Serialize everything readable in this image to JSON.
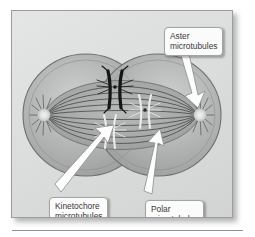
{
  "figure": {
    "domain_subject": "mitotic spindle diagram",
    "callouts": [
      {
        "id": "aster",
        "line1": "Aster",
        "line2": "microtubules",
        "points_to": "right-aster-starburst"
      },
      {
        "id": "kinetochore",
        "line1": "Kinetochore",
        "line2": "microtubules",
        "points_to": "lower-left-chromosome-kinetochore"
      },
      {
        "id": "polar",
        "line1": "Polar",
        "line2": "microtubules",
        "points_to": "overlapping-spindle-fibers"
      }
    ],
    "colors": {
      "panel_background_light": "#e4e5e5",
      "panel_background_dark": "#d2d3d3",
      "panel_border": "#9b9c9c",
      "cell_fill": "#a9aaaa",
      "cell_outline": "#6d6e6e",
      "spindle_fiber": "#4a4b4b",
      "chromosome_dark": "#151515",
      "chromosome_light": "#e9eaea",
      "aster_pole": "#e6e7e7",
      "arrow_fill": "#fdfdfd",
      "arrow_outline": "#8d8e8e",
      "callout_background": "#fbfbfb",
      "callout_border": "#a2a3a3",
      "callout_text": "#3a3a3a",
      "rule": "#8e8f8f"
    },
    "structures": {
      "cell_count": 2,
      "aster_count": 2,
      "chromosome_count": 3,
      "spindle_fiber_count": 10
    }
  }
}
